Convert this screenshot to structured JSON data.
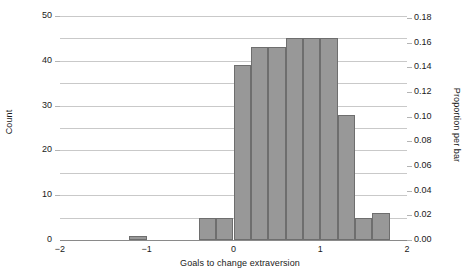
{
  "chart_data": {
    "type": "bar",
    "title": "",
    "subtitle": "",
    "xlabel": "Goals to change extraversion",
    "ylabel": "Count",
    "ylabel_secondary": "Proportion per bar",
    "xlim": [
      -2,
      2
    ],
    "ylim": [
      0,
      50
    ],
    "ylim_secondary": [
      0.0,
      0.18
    ],
    "grid": true,
    "legend": null,
    "bin_width": 0.2,
    "xticks": [
      "-2",
      "-1",
      "0",
      "1",
      "2"
    ],
    "xtick_values": [
      -2,
      -1,
      0,
      1,
      2
    ],
    "yticks_left": [
      "0",
      "10",
      "20",
      "30",
      "40",
      "50"
    ],
    "ytick_values_left": [
      0,
      10,
      20,
      30,
      40,
      50
    ],
    "yticks_right": [
      "0.00",
      "0.02",
      "0.04",
      "0.06",
      "0.08",
      "0.10",
      "0.12",
      "0.14",
      "0.16",
      "0.18"
    ],
    "ytick_values_right": [
      0.0,
      0.02,
      0.04,
      0.06,
      0.08,
      0.1,
      0.12,
      0.14,
      0.16,
      0.18
    ],
    "bar_color": "#989898",
    "bar_edge_color": "#6e6e6e",
    "grid_color": "#c9c9c9",
    "bins": [
      {
        "x0": -1.2,
        "x1": -1.0,
        "count": 1,
        "proportion": 0.004
      },
      {
        "x0": -0.4,
        "x1": -0.2,
        "count": 5,
        "proportion": 0.018
      },
      {
        "x0": -0.2,
        "x1": 0.0,
        "count": 5,
        "proportion": 0.018
      },
      {
        "x0": 0.0,
        "x1": 0.2,
        "count": 39,
        "proportion": 0.14
      },
      {
        "x0": 0.2,
        "x1": 0.4,
        "count": 43,
        "proportion": 0.155
      },
      {
        "x0": 0.4,
        "x1": 0.6,
        "count": 43,
        "proportion": 0.155
      },
      {
        "x0": 0.6,
        "x1": 0.8,
        "count": 45,
        "proportion": 0.162
      },
      {
        "x0": 0.8,
        "x1": 1.0,
        "count": 45,
        "proportion": 0.162
      },
      {
        "x0": 1.0,
        "x1": 1.2,
        "count": 45,
        "proportion": 0.162
      },
      {
        "x0": 1.2,
        "x1": 1.4,
        "count": 28,
        "proportion": 0.101
      },
      {
        "x0": 1.4,
        "x1": 1.6,
        "count": 5,
        "proportion": 0.018
      },
      {
        "x0": 1.6,
        "x1": 1.8,
        "count": 6,
        "proportion": 0.022
      }
    ]
  }
}
